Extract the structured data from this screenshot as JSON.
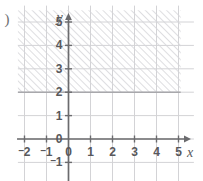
{
  "figure": {
    "part_label": ")",
    "background_color": "#ffffff"
  },
  "axes": {
    "x_name": "x",
    "y_name": "y",
    "axis_color": "#6b6b6e",
    "grid_color": "#d3d3d6",
    "boundary_color": "#a6a6aa",
    "hatch_color": "#d8d8db",
    "label_color": "#58585b",
    "x_ticks": [
      {
        "label": "2",
        "negative": true,
        "value": -2
      },
      {
        "label": "1",
        "negative": true,
        "value": -1
      },
      {
        "label": "0",
        "negative": false,
        "value": 0
      },
      {
        "label": "1",
        "negative": false,
        "value": 1
      },
      {
        "label": "2",
        "negative": false,
        "value": 2
      },
      {
        "label": "3",
        "negative": false,
        "value": 3
      },
      {
        "label": "4",
        "negative": false,
        "value": 4
      },
      {
        "label": "5",
        "negative": false,
        "value": 5
      }
    ],
    "y_ticks": [
      {
        "label": "5",
        "negative": false,
        "value": 5
      },
      {
        "label": "4",
        "negative": false,
        "value": 4
      },
      {
        "label": "3",
        "negative": false,
        "value": 3
      },
      {
        "label": "2",
        "negative": false,
        "value": 2
      },
      {
        "label": "1",
        "negative": false,
        "value": 1
      },
      {
        "label": "0",
        "negative": false,
        "value": 0
      },
      {
        "label": "1",
        "negative": true,
        "value": -1
      }
    ]
  },
  "chart_data": {
    "type": "area",
    "title": "",
    "xlabel": "x",
    "ylabel": "y",
    "xlim": [
      -2.3,
      5.7
    ],
    "ylim": [
      -1.3,
      5.7
    ],
    "xticks": [
      -2,
      -1,
      0,
      1,
      2,
      3,
      4,
      5
    ],
    "yticks": [
      -1,
      0,
      1,
      2,
      3,
      4,
      5
    ],
    "grid": true,
    "legend": null,
    "shaded_regions": [
      {
        "name": "y-greater-or-equal-2",
        "inequality": "y >= 2",
        "boundary_type": "solid",
        "boundary_value": 2,
        "boundary_orientation": "horizontal",
        "fill_style": "diagonal-hatch",
        "hatch_angle_degrees": 45,
        "shade_direction": "above",
        "x_range": [
          -2.3,
          5.1
        ],
        "y_range": [
          2,
          5.5
        ]
      }
    ]
  }
}
